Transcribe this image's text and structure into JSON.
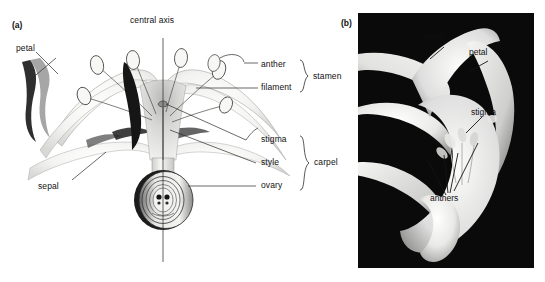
{
  "figure": {
    "panels": [
      {
        "tag": "(a)",
        "type": "line-drawing",
        "axis_label": "central axis",
        "labels": [
          {
            "name": "petal",
            "text": "petal"
          },
          {
            "name": "sepal",
            "text": "sepal"
          },
          {
            "name": "anther",
            "text": "anther"
          },
          {
            "name": "filament",
            "text": "filament"
          },
          {
            "name": "stamen",
            "text": "stamen"
          },
          {
            "name": "stigma",
            "text": "stigma"
          },
          {
            "name": "style",
            "text": "style"
          },
          {
            "name": "ovary",
            "text": "ovary"
          },
          {
            "name": "carpel",
            "text": "carpel"
          }
        ],
        "bracket_groups": [
          {
            "name": "stamen",
            "label": "stamen",
            "members": [
              "anther",
              "filament"
            ]
          },
          {
            "name": "carpel",
            "label": "carpel",
            "members": [
              "stigma",
              "style",
              "ovary"
            ]
          }
        ]
      },
      {
        "tag": "(b)",
        "type": "photograph",
        "labels": [
          {
            "name": "sepal",
            "text": "sepal"
          },
          {
            "name": "petal",
            "text": "petal"
          },
          {
            "name": "stigma",
            "text": "stigma"
          },
          {
            "name": "anthers",
            "text": "anthers"
          }
        ]
      }
    ]
  },
  "colors": {
    "background": "#ffffff",
    "ink": "#111111",
    "photo_background": "#0a0a0a",
    "petal_light": "#f2f2f0",
    "petal_shade": "#c9c9c7",
    "dark_accent": "#1a1a1a"
  }
}
